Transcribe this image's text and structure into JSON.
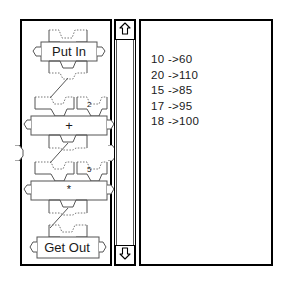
{
  "app": {
    "title": "Blocks Program Editor",
    "accent_color": "#000000",
    "background_color": "#ffffff",
    "text_color": "#1a1a1a",
    "block_outline_color": "#555555"
  },
  "canvas": {
    "name": "program-canvas",
    "left_connector_icon": "connector-tab-icon",
    "right_connector_icon": "connector-tab-icon",
    "blocks": [
      {
        "id": "put-in",
        "label": "Put In",
        "kind": "input-block",
        "arg": "",
        "left_port_icon": "port-tab-icon",
        "right_port_icon": "port-tab-icon"
      },
      {
        "id": "plus",
        "label": "+",
        "kind": "operator-block",
        "arg": "2",
        "left_port_icon": "port-tab-icon",
        "right_port_icon": "port-tab-icon"
      },
      {
        "id": "times",
        "label": "*",
        "kind": "operator-block",
        "arg": "5",
        "left_port_icon": "port-tab-icon",
        "right_port_icon": "port-tab-icon"
      },
      {
        "id": "get-out",
        "label": "Get Out",
        "kind": "output-block",
        "arg": "",
        "left_port_icon": "port-tab-icon",
        "right_port_icon": "port-tab-icon"
      }
    ]
  },
  "scrollbar": {
    "name": "vertical-scrollbar",
    "up_icon": "arrow-up-icon",
    "down_icon": "arrow-down-icon",
    "orientation": "vertical"
  },
  "results": {
    "name": "results-panel",
    "rows": [
      "10 ->60",
      "20 ->110",
      "15 ->85",
      "17 ->95",
      "18 ->100"
    ]
  }
}
